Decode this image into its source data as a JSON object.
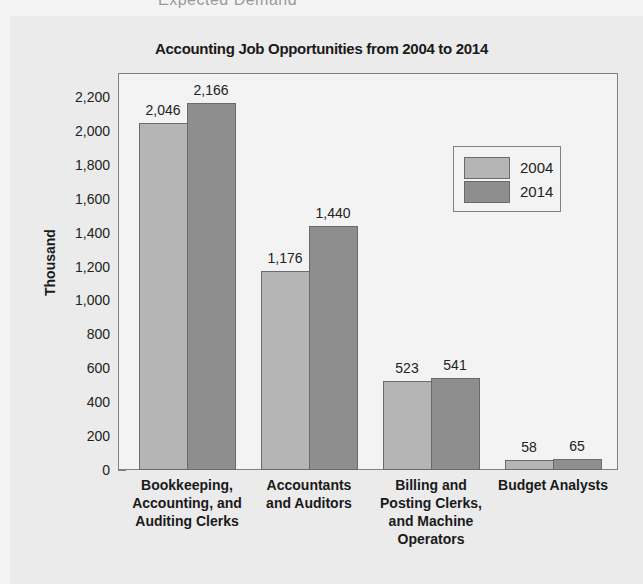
{
  "page": {
    "top_fragment": "Expected Demand"
  },
  "chart_data": {
    "type": "bar",
    "title": "Accounting Job Opportunities from 2004 to 2014",
    "xlabel": "",
    "ylabel": "Thousand",
    "ylim": [
      0,
      2300
    ],
    "yticks": [
      "0",
      "200",
      "400",
      "600",
      "800",
      "1,000",
      "1,200",
      "1,400",
      "1,600",
      "1,800",
      "2,000",
      "2,200"
    ],
    "categories": [
      "Bookkeeping,\nAccounting, and\nAuditing Clerks",
      "Accountants\nand Auditors",
      "Billing and\nPosting Clerks,\nand Machine\nOperators",
      "Budget Analysts"
    ],
    "series": [
      {
        "name": "2004",
        "color": "#b5b5b5",
        "values": [
          2046,
          1176,
          523,
          58
        ],
        "labels": [
          "2,046",
          "1,176",
          "523",
          "58"
        ]
      },
      {
        "name": "2014",
        "color": "#8e8e8e",
        "values": [
          2166,
          1440,
          541,
          65
        ],
        "labels": [
          "2,166",
          "1,440",
          "541",
          "65"
        ]
      }
    ],
    "legend": {
      "position": "upper right",
      "entries": [
        "2004",
        "2014"
      ]
    },
    "grid": false
  }
}
